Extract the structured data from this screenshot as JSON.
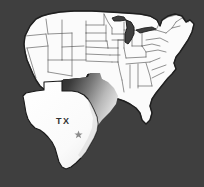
{
  "figure": {
    "kind": "map",
    "background_color": "#3f3f3f",
    "land_color": "#fbfbfb",
    "border_color": "#4a4a4a",
    "outline_color": "#1f1f1f",
    "shadow_dark": "#2b2b2b",
    "shadow_light": "#f2f2f2"
  },
  "highlight": {
    "state_code": "TX",
    "state_label": "TX",
    "label_color": "#303030",
    "marker": {
      "name": "capital-star",
      "shape": "star",
      "points": 5,
      "color": "#8c8c8c"
    },
    "effect": "cut-out pop-out with gradient drop shadow"
  },
  "legend": {
    "visible": false
  }
}
